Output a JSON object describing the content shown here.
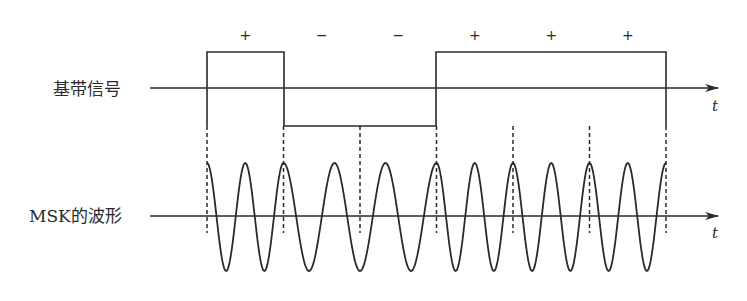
{
  "diagram": {
    "baseband": {
      "label": "基带信号",
      "axis_label": "t",
      "bits": [
        "+",
        "−",
        "−",
        "+",
        "+",
        "+"
      ]
    },
    "msk": {
      "label": "MSK的波形",
      "axis_label": "t",
      "cycles_per_bit": {
        "+": 2,
        "−": 1.5
      }
    },
    "colors": {
      "stroke": "#2a2a2a",
      "background": "#ffffff"
    }
  }
}
